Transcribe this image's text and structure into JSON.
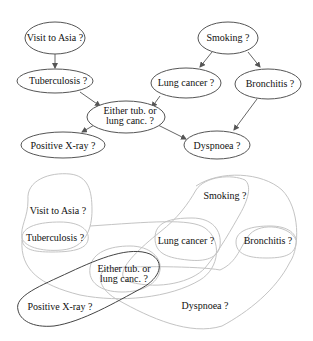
{
  "top_graph": {
    "nodes": [
      {
        "id": "asia",
        "label": "Visit to Asia ?"
      },
      {
        "id": "tub",
        "label": "Tuberculosis ?"
      },
      {
        "id": "either_l1",
        "label": "Either tub. or"
      },
      {
        "id": "either_l2",
        "label": "lung canc. ?"
      },
      {
        "id": "xray",
        "label": "Positive X-ray ?"
      },
      {
        "id": "smoke",
        "label": "Smoking ?"
      },
      {
        "id": "lung",
        "label": "Lung cancer ?"
      },
      {
        "id": "bronc",
        "label": "Bronchitis ?"
      },
      {
        "id": "dysp",
        "label": "Dyspnoea ?"
      }
    ],
    "edges": [
      {
        "from": "Visit to Asia ?",
        "to": "Tuberculosis ?"
      },
      {
        "from": "Tuberculosis ?",
        "to": "Either tub. or lung canc. ?"
      },
      {
        "from": "Lung cancer ?",
        "to": "Either tub. or lung canc. ?"
      },
      {
        "from": "Smoking ?",
        "to": "Lung cancer ?"
      },
      {
        "from": "Smoking ?",
        "to": "Bronchitis ?"
      },
      {
        "from": "Either tub. or lung canc. ?",
        "to": "Positive X-ray ?"
      },
      {
        "from": "Either tub. or lung canc. ?",
        "to": "Dyspnoea ?"
      },
      {
        "from": "Bronchitis ?",
        "to": "Dyspnoea ?"
      }
    ]
  },
  "bottom_graph": {
    "labels": {
      "asia": "Visit to Asia ?",
      "tub": "Tuberculosis ?",
      "either_l1": "Either tub. or",
      "either_l2": "lung canc. ?",
      "xray": "Positive X-ray ?",
      "smoke": "Smoking ?",
      "lung": "Lung cancer ?",
      "bronc": "Bronchitis ?",
      "dysp": "Dyspnoea ?"
    },
    "cliques": [
      [
        "Visit to Asia ?",
        "Tuberculosis ?"
      ],
      [
        "Tuberculosis ?",
        "Lung cancer ?",
        "Either tub. or lung canc. ?"
      ],
      [
        "Smoking ?",
        "Lung cancer ?",
        "Bronchitis ?"
      ],
      [
        "Lung cancer ?",
        "Bronchitis ?",
        "Either tub. or lung canc. ?"
      ],
      [
        "Either tub. or lung canc. ?",
        "Bronchitis ?",
        "Dyspnoea ?"
      ],
      [
        "Either tub. or lung canc. ?",
        "Positive X-ray ?"
      ]
    ],
    "highlighted_clique": [
      "Either tub. or lung canc. ?",
      "Positive X-ray ?"
    ]
  },
  "colors": {
    "node_stroke": "#555555",
    "region_stroke": "#c4c4c4",
    "highlight_stroke": "#444444",
    "text": "#111111"
  }
}
